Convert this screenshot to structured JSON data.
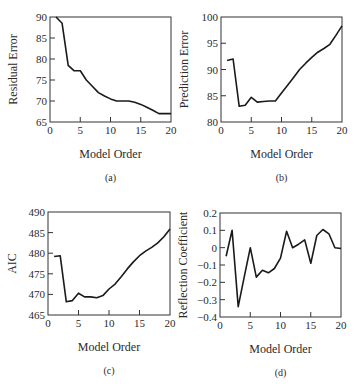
{
  "chart_data": [
    {
      "panel": "(a)",
      "type": "line",
      "title": "",
      "xlabel": "Model Order",
      "ylabel": "Residual Error",
      "xlim": [
        0,
        20
      ],
      "ylim": [
        65,
        90
      ],
      "xticks": [
        0,
        5,
        10,
        15,
        20
      ],
      "yticks": [
        65,
        70,
        75,
        80,
        85,
        90
      ],
      "grid": false,
      "x": [
        1,
        2,
        3,
        4,
        5,
        6,
        7,
        8,
        9,
        10,
        11,
        12,
        13,
        14,
        15,
        16,
        17,
        18,
        19,
        20
      ],
      "y": [
        90,
        88.5,
        78.5,
        77.2,
        77.2,
        75,
        73.5,
        72,
        71.2,
        70.5,
        70,
        70,
        70,
        69.7,
        69.2,
        68.5,
        67.8,
        67,
        67,
        67
      ],
      "box": {
        "left": 50,
        "top": 17,
        "right": 171,
        "bottom": 122
      }
    },
    {
      "panel": "(b)",
      "type": "line",
      "title": "",
      "xlabel": "Model Order",
      "ylabel": "Prediction Error",
      "xlim": [
        0,
        20
      ],
      "ylim": [
        80,
        100
      ],
      "xticks": [
        0,
        5,
        10,
        15,
        20
      ],
      "yticks": [
        80,
        85,
        90,
        95,
        100
      ],
      "grid": false,
      "x": [
        1,
        2,
        3,
        4,
        5,
        6,
        7,
        8,
        9,
        10,
        11,
        12,
        13,
        14,
        15,
        16,
        17,
        18,
        19,
        20
      ],
      "y": [
        91.7,
        92,
        83,
        83.2,
        84.7,
        83.8,
        83.9,
        84,
        84,
        85.5,
        87,
        88.5,
        90,
        91.2,
        92.3,
        93.3,
        94,
        94.8,
        96.5,
        98.3
      ],
      "box": {
        "left": 221,
        "top": 17,
        "right": 342,
        "bottom": 122
      }
    },
    {
      "panel": "(c)",
      "type": "line",
      "title": "",
      "xlabel": "Model Order",
      "ylabel": "AIC",
      "xlim": [
        0,
        20
      ],
      "ylim": [
        465,
        490
      ],
      "xticks": [
        0,
        5,
        10,
        15,
        20
      ],
      "yticks": [
        465,
        470,
        475,
        480,
        485,
        490
      ],
      "grid": false,
      "x": [
        1,
        2,
        3,
        4,
        5,
        6,
        7,
        8,
        9,
        10,
        11,
        12,
        13,
        14,
        15,
        16,
        17,
        18,
        19,
        20
      ],
      "y": [
        479.2,
        479.4,
        468.2,
        468.5,
        470.3,
        469.4,
        469.4,
        469.2,
        469.7,
        471.3,
        472.5,
        474.3,
        476.2,
        477.9,
        479.4,
        480.5,
        481.4,
        482.5,
        484,
        485.9
      ],
      "box": {
        "left": 48,
        "top": 212,
        "right": 170,
        "bottom": 315
      }
    },
    {
      "panel": "(d)",
      "type": "line",
      "title": "",
      "xlabel": "Model Order",
      "ylabel": "Reflection Coefficient",
      "xlim": [
        0,
        20
      ],
      "ylim": [
        -0.4,
        0.2
      ],
      "xticks": [
        0,
        5,
        10,
        15,
        20
      ],
      "yticks": [
        -0.4,
        -0.3,
        -0.2,
        -0.1,
        0,
        0.1,
        0.2
      ],
      "ytick_labels": [
        "−0.4",
        "−0.3",
        "−0.2",
        "−0.1",
        "0",
        "0.1",
        "0.2"
      ],
      "grid": false,
      "x": [
        1,
        2,
        3,
        4,
        5,
        6,
        7,
        8,
        9,
        10,
        11,
        12,
        13,
        14,
        15,
        16,
        17,
        18,
        19,
        20
      ],
      "y": [
        -0.05,
        0.1,
        -0.34,
        -0.17,
        0,
        -0.17,
        -0.13,
        -0.145,
        -0.12,
        -0.06,
        0.095,
        0,
        0.02,
        0.045,
        -0.09,
        0.07,
        0.105,
        0.08,
        0,
        -0.005
      ],
      "box": {
        "left": 220,
        "top": 213,
        "right": 341,
        "bottom": 317
      }
    }
  ],
  "style": {
    "line_color": "#1a1a1a",
    "axis_color": "#333333",
    "text_color": "#2a2a2a"
  }
}
